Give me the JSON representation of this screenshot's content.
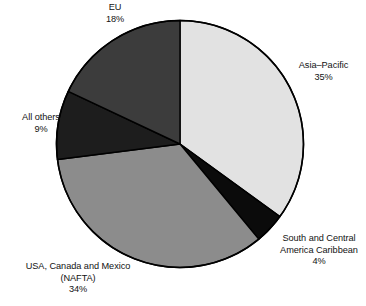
{
  "chart_data": {
    "type": "pie",
    "title": "",
    "subtitle": "",
    "xlabel": "",
    "ylabel": "",
    "legend_position": "none",
    "grid": false,
    "labels_outside": true,
    "value_unit": "%",
    "categories": [
      "Asia-Pacific",
      "South and Central America Caribbean",
      "USA, Canada and Mexico (NAFTA)",
      "All others",
      "EU"
    ],
    "values": [
      35,
      4,
      34,
      9,
      18
    ],
    "start_angle_deg": 0,
    "direction": "clockwise",
    "slices": [
      {
        "name": "Asia-Pacific",
        "value": 35,
        "value_label": "35%",
        "color": "#e2e2e2",
        "start_deg": 0,
        "end_deg": 126
      },
      {
        "name": "South and Central America Caribbean",
        "value": 4,
        "value_label": "4%",
        "color": "#0b0b0b",
        "start_deg": 126,
        "end_deg": 140.4
      },
      {
        "name": "USA, Canada and Mexico (NAFTA)",
        "value": 34,
        "value_label": "34%",
        "color": "#8c8c8c",
        "start_deg": 140.4,
        "end_deg": 262.8
      },
      {
        "name": "All others",
        "value": 9,
        "value_label": "9%",
        "color": "#1d1d1d",
        "start_deg": 262.8,
        "end_deg": 295.2
      },
      {
        "name": "EU",
        "value": 18,
        "value_label": "18%",
        "color": "#3c3c3c",
        "start_deg": 295.2,
        "end_deg": 360
      }
    ]
  },
  "labels": {
    "eu": {
      "line1": "EU",
      "line2": "18%"
    },
    "asia_pacific": {
      "line1": "Asia–Pacific",
      "line2": "35%"
    },
    "south_central_america": {
      "line1": "South and Central",
      "line2": "America Caribbean",
      "line3": "4%"
    },
    "nafta": {
      "line1": "USA, Canada and Mexico",
      "line2": "(NAFTA)",
      "line3": "34%"
    },
    "all_others": {
      "line1": "All others",
      "line2": "9%"
    }
  },
  "style": {
    "background": "#ffffff",
    "outline_color": "#000000",
    "text_color": "#121212"
  }
}
